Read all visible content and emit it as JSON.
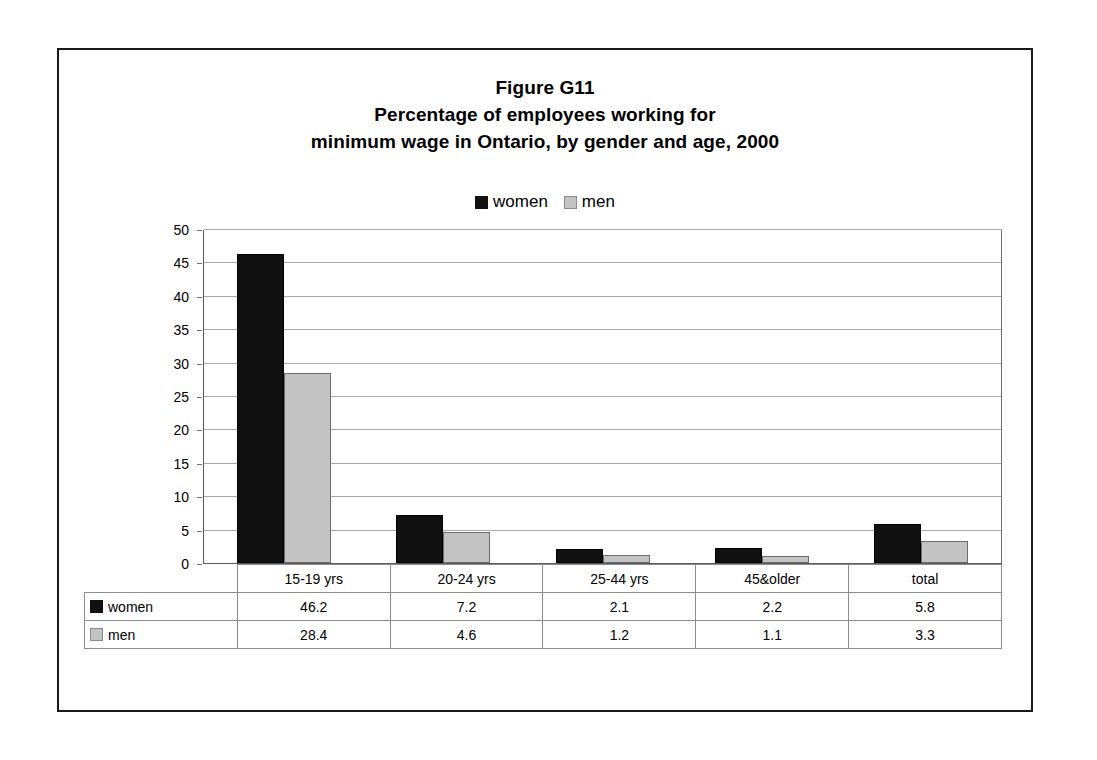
{
  "title": {
    "line1": "Figure G11",
    "line2": "Percentage of employees working for",
    "line3": "minimum wage in Ontario, by gender and age, 2000"
  },
  "legend": {
    "women_label": "women",
    "men_label": "men"
  },
  "colors": {
    "women": "#111111",
    "men": "#c3c3c3",
    "gridline": "#a8a8a8",
    "axis": "#5a5a5a",
    "frame": "#1a1a1a"
  },
  "chart_data": {
    "type": "bar",
    "xlabel": "",
    "ylabel": "",
    "ylim": [
      0,
      50
    ],
    "yticks": [
      50,
      45,
      40,
      35,
      30,
      25,
      20,
      15,
      10,
      5,
      0
    ],
    "grid": true,
    "legend_position": "top-center",
    "categories": [
      "15-19 yrs",
      "20-24 yrs",
      "25-44 yrs",
      "45&older",
      "total"
    ],
    "series": [
      {
        "name": "women",
        "values": [
          46.2,
          7.2,
          2.1,
          2.2,
          5.8
        ]
      },
      {
        "name": "men",
        "values": [
          28.4,
          4.6,
          1.2,
          1.1,
          3.3
        ]
      }
    ]
  },
  "table": {
    "row_labels": [
      "women",
      "men"
    ],
    "header": [
      "15-19 yrs",
      "20-24 yrs",
      "25-44 yrs",
      "45&older",
      "total"
    ],
    "rows": [
      [
        "46.2",
        "7.2",
        "2.1",
        "2.2",
        "5.8"
      ],
      [
        "28.4",
        "4.6",
        "1.2",
        "1.1",
        "3.3"
      ]
    ]
  }
}
